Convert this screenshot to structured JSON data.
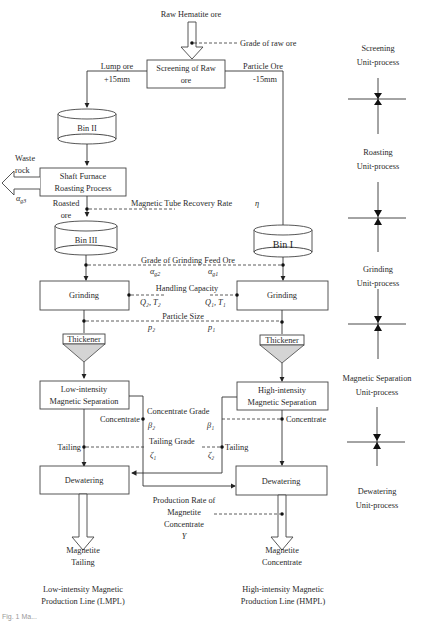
{
  "diagram": {
    "input": {
      "label": "Raw Hematite ore",
      "measure": "Grade of raw ore"
    },
    "screening": {
      "line1": "Screening of Raw",
      "line2": "ore"
    },
    "lump_ore": {
      "line1": "Lump ore",
      "line2": "+15mm"
    },
    "particle_ore": {
      "line1": "Particle Ore",
      "line2": "-15mm"
    },
    "bins": {
      "bin2": "Bin II",
      "bin3": "Bin III",
      "bin1": "Bin I"
    },
    "roasting": {
      "line1": "Shaft Furnace",
      "line2": "Roasting Process"
    },
    "waste": {
      "line1": "Waste",
      "line2": "rock",
      "symbol": "α",
      "subscript": "g3"
    },
    "roasted_ore": {
      "line1": "Roasted",
      "line2": "ore"
    },
    "magnetic_tube": {
      "label": "Magnetic Tube Recovery Rate",
      "symbol": "η"
    },
    "grinding_feed": {
      "label": "Grade of Grinding Feed Ore",
      "left_symbol": "α",
      "left_sub": "g2",
      "right_symbol": "α",
      "right_sub": "g1"
    },
    "grinding": {
      "left": "Grinding",
      "right": "Grinding"
    },
    "handling": {
      "label": "Handling Capacity",
      "left": "Q₂, T₂",
      "right": "Q₁, T₁"
    },
    "particle_size": {
      "label": "Particle Size",
      "left": "p₂",
      "right": "p₁"
    },
    "thickener": {
      "left": "Thickener",
      "right": "Thickener"
    },
    "low_sep": {
      "line1": "Low-intensity",
      "line2": "Magnetic Separation"
    },
    "high_sep": {
      "line1": "High-intensity",
      "line2": "Magnetic Separation"
    },
    "concentrate_label_left": "Concentrate",
    "concentrate_label_right": "Concentrate",
    "concentrate_grade": {
      "label": "Concentrate Grade",
      "left": "β₂",
      "right": "β₁"
    },
    "tailing_label_left": "Tailing",
    "tailing_label_right": "Tailing",
    "tailing_grade": {
      "label": "Tailing Grade",
      "left": "ζ₁",
      "right": "ζ₂"
    },
    "dewatering": {
      "left": "Dewatering",
      "right": "Dewatering"
    },
    "production_rate": {
      "line1": "Production Rate of",
      "line2": "Magnetite",
      "line3": "Concentrate",
      "symbol": "Y"
    },
    "outputs": {
      "left": {
        "line1": "Magnetite",
        "line2": "Tailing"
      },
      "right": {
        "line1": "Magnetite",
        "line2": "Concentrate"
      }
    },
    "lines": {
      "left": {
        "line1": "Low-intensity Magnetic",
        "line2": "Production Line (LMPL)"
      },
      "right": {
        "line1": "High-intensity Magnetic",
        "line2": "Production Line (HMPL)"
      }
    },
    "unit_processes": [
      {
        "line1": "Screening",
        "line2": "Unit-process"
      },
      {
        "line1": "Roasting",
        "line2": "Unit-process"
      },
      {
        "line1": "Grinding",
        "line2": "Unit-process"
      },
      {
        "line1": "Magnetic Separation",
        "line2": "Unit-process"
      },
      {
        "line1": "Dewatering",
        "line2": "Unit-process"
      }
    ],
    "caption": "Fig. 1 Ma..."
  }
}
